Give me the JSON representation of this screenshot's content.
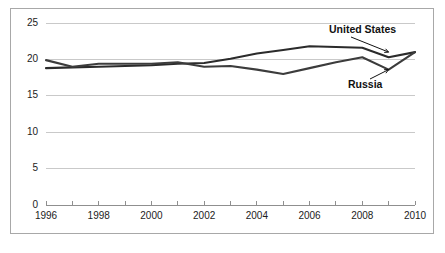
{
  "chart_data": {
    "type": "line",
    "title": "",
    "subtitle": "",
    "xlabel": "",
    "ylabel": "",
    "xlim": [
      1996,
      2010
    ],
    "ylim": [
      0,
      25
    ],
    "grid": true,
    "legend_position": "inline-annotations",
    "x": [
      1996,
      1997,
      1998,
      1999,
      2000,
      2001,
      2002,
      2003,
      2004,
      2005,
      2006,
      2007,
      2008,
      2009,
      2010
    ],
    "x_tick_labels": [
      "1996",
      "1998",
      "2000",
      "2002",
      "2004",
      "2006",
      "2008",
      "2010"
    ],
    "x_tick_values": [
      1996,
      1998,
      2000,
      2002,
      2004,
      2006,
      2008,
      2010
    ],
    "y_tick_labels": [
      "0",
      "5",
      "10",
      "15",
      "20",
      "25"
    ],
    "y_tick_values": [
      0,
      5,
      10,
      15,
      20,
      25
    ],
    "series": [
      {
        "name": "United States",
        "color": "#2b2b2b",
        "values": [
          18.8,
          18.9,
          19.0,
          19.1,
          19.2,
          19.4,
          19.5,
          20.1,
          20.8,
          21.3,
          21.8,
          21.7,
          21.6,
          20.3,
          21.0
        ]
      },
      {
        "name": "Russia",
        "color": "#3c3c3c",
        "values": [
          19.9,
          19.0,
          19.4,
          19.4,
          19.4,
          19.6,
          19.0,
          19.1,
          18.6,
          18.0,
          18.8,
          19.6,
          20.3,
          18.6,
          21.0
        ]
      }
    ],
    "annotations": [
      {
        "id": "united-states",
        "text": "United States",
        "points_to_year": 2009,
        "points_to_value": 21.0
      },
      {
        "id": "russia",
        "text": "Russia",
        "points_to_year": 2009,
        "points_to_value": 18.6
      }
    ]
  }
}
